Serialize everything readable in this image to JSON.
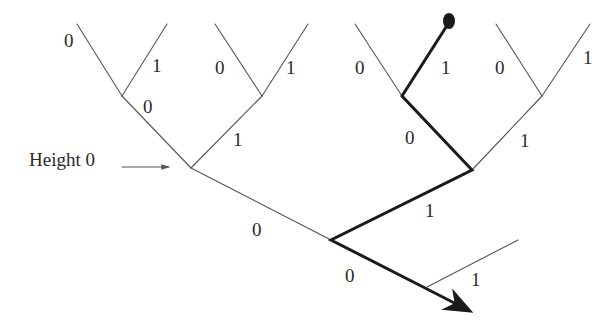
{
  "diagram": {
    "type": "binary-tree-path",
    "annotation": {
      "text": "Height 0"
    },
    "colors": {
      "thin_edge": "#555555",
      "thick_path": "#1a1a1a",
      "text": "#2a2a2a",
      "background": "#ffffff"
    },
    "nodes": {
      "leaf_pair_1_left": [
        77,
        24
      ],
      "leaf_pair_1_right": [
        167,
        24
      ],
      "n1": [
        122,
        96
      ],
      "leaf_pair_2_left": [
        215,
        24
      ],
      "leaf_pair_2_right": [
        308,
        24
      ],
      "n2": [
        262,
        96
      ],
      "leaf_pair_3_left": [
        355,
        24
      ],
      "leaf_dot": [
        448,
        22
      ],
      "n3": [
        402,
        96
      ],
      "leaf_pair_4_left": [
        496,
        24
      ],
      "leaf_pair_4_right": [
        590,
        24
      ],
      "n4": [
        542,
        96
      ],
      "height0_node": [
        191,
        168
      ],
      "nB": [
        472,
        170
      ],
      "nC": [
        331,
        240
      ],
      "nD": [
        427,
        287
      ],
      "branch_end": [
        518,
        240
      ],
      "arrow_tip": [
        475,
        314
      ]
    },
    "labels": [
      {
        "id": "l1",
        "text": "0",
        "x": 64,
        "y": 31
      },
      {
        "id": "l2",
        "text": "1",
        "x": 152,
        "y": 56
      },
      {
        "id": "l3",
        "text": "0",
        "x": 215,
        "y": 34
      },
      {
        "id": "l4",
        "text": "1",
        "x": 286,
        "y": 58
      },
      {
        "id": "l5",
        "text": "0",
        "x": 143,
        "y": 97
      },
      {
        "id": "l6",
        "text": "1",
        "x": 233,
        "y": 130
      },
      {
        "id": "l7",
        "text": "0",
        "x": 355,
        "y": 58
      },
      {
        "id": "l8",
        "text": "1",
        "x": 441,
        "y": 58
      },
      {
        "id": "l9",
        "text": "0",
        "x": 495,
        "y": 58
      },
      {
        "id": "l10",
        "text": "1",
        "x": 583,
        "y": 48
      },
      {
        "id": "l11",
        "text": "0",
        "x": 405,
        "y": 128
      },
      {
        "id": "l12",
        "text": "1",
        "x": 520,
        "y": 131
      },
      {
        "id": "l13",
        "text": "0",
        "x": 252,
        "y": 220
      },
      {
        "id": "l14",
        "text": "1",
        "x": 425,
        "y": 201
      },
      {
        "id": "l15",
        "text": "0",
        "x": 345,
        "y": 266
      },
      {
        "id": "l16",
        "text": "1",
        "x": 471,
        "y": 270
      }
    ]
  }
}
